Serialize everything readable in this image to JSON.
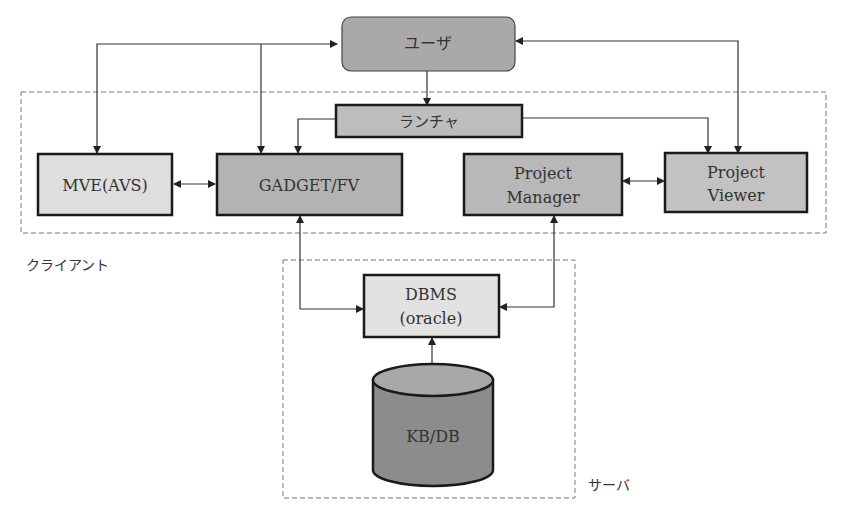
{
  "nodes": {
    "user": {
      "label": "ユーザ",
      "fill": "#a9a9a9"
    },
    "launcher": {
      "label": "ランチャ",
      "fill": "#bdbdbd"
    },
    "mve": {
      "label": "MVE(AVS)",
      "fill": "#dedede"
    },
    "gadget": {
      "label": "GADGET/FV",
      "fill": "#b3b3b3"
    },
    "pm": {
      "line1": "Project",
      "line2": "Manager",
      "fill": "#b8b8b8"
    },
    "pv": {
      "line1": "Project",
      "line2": "Viewer",
      "fill": "#c2c2c2"
    },
    "dbms": {
      "line1": "DBMS",
      "line2": "(oracle)",
      "fill": "#e2e2e2"
    },
    "kbdb": {
      "label": "KB/DB",
      "fill": "#8c8c8c",
      "top_fill": "#a8a8a8"
    }
  },
  "groups": {
    "client": {
      "label": "クライアント"
    },
    "server": {
      "label": "サーバ"
    }
  }
}
